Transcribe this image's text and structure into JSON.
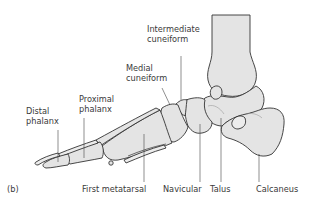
{
  "figure": {
    "panel_label": "(b)",
    "labels": {
      "intermediate_cuneiform": [
        "Intermediate",
        "cuneiform"
      ],
      "medial_cuneiform": [
        "Medial",
        "cuneiform"
      ],
      "proximal_phalanx": [
        "Proximal",
        "phalanx"
      ],
      "distal_phalanx": [
        "Distal",
        "phalanx"
      ],
      "first_metatarsal": "First metatarsal",
      "navicular": "Navicular",
      "talus": "Talus",
      "calcaneus": "Calcaneus"
    },
    "colors": {
      "bone_fill": "#e4e4e4",
      "outline": "#333333",
      "label_text": "#3a3a3a"
    }
  }
}
